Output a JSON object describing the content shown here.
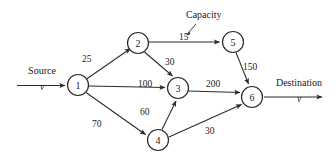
{
  "figure": {
    "type": "network-flow-diagram",
    "annotation": {
      "capacity_label": "Capacity",
      "points_to_edge": "2-5"
    },
    "terminals": {
      "source": {
        "title": "Source",
        "sub": "v"
      },
      "destination": {
        "title": "Destination",
        "sub": "v"
      }
    },
    "nodes": [
      {
        "id": "1",
        "label": "1",
        "cx": 78,
        "cy": 85,
        "r": 10.5
      },
      {
        "id": "2",
        "label": "2",
        "cx": 138,
        "cy": 43,
        "r": 10.5
      },
      {
        "id": "3",
        "label": "3",
        "cx": 178,
        "cy": 88,
        "r": 10.5
      },
      {
        "id": "4",
        "label": "4",
        "cx": 158,
        "cy": 140,
        "r": 10.5
      },
      {
        "id": "5",
        "label": "5",
        "cx": 233,
        "cy": 42,
        "r": 10.5
      },
      {
        "id": "6",
        "label": "6",
        "cx": 252,
        "cy": 97,
        "r": 10.5
      }
    ],
    "edges": [
      {
        "from": "1",
        "to": "2",
        "capacity": "25",
        "label_x": 82,
        "label_y": 55
      },
      {
        "from": "2",
        "to": "5",
        "capacity": "15",
        "label_x": 179,
        "label_y": 33
      },
      {
        "from": "2",
        "to": "3",
        "capacity": "30",
        "label_x": 165,
        "label_y": 58
      },
      {
        "from": "1",
        "to": "3",
        "capacity": "100",
        "label_x": 138,
        "label_y": 80
      },
      {
        "from": "1",
        "to": "4",
        "capacity": "70",
        "label_x": 92,
        "label_y": 120
      },
      {
        "from": "4",
        "to": "3",
        "capacity": "60",
        "label_x": 140,
        "label_y": 108
      },
      {
        "from": "3",
        "to": "6",
        "capacity": "200",
        "label_x": 206,
        "label_y": 80
      },
      {
        "from": "5",
        "to": "6",
        "capacity": "150",
        "label_x": 243,
        "label_y": 63
      },
      {
        "from": "4",
        "to": "6",
        "capacity": "30",
        "label_x": 205,
        "label_y": 127
      }
    ]
  }
}
